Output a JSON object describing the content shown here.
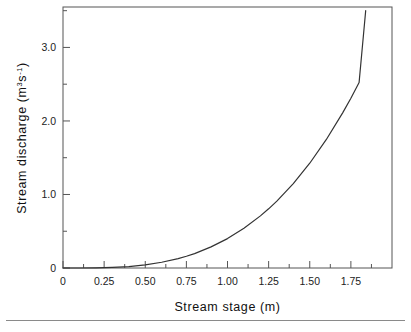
{
  "chart_data": {
    "type": "line",
    "title": "",
    "subtitle": "",
    "xlabel": "Stream  stage  (m)",
    "ylabel_parts": {
      "main": "Stream discharge  (m",
      "sup1": "3",
      "mid": "s",
      "sup2": "-1",
      "tail": ")"
    },
    "ylabel": "Stream discharge (m3s-1)",
    "xlim": [
      0,
      2.0
    ],
    "ylim": [
      0,
      3.55
    ],
    "grid": false,
    "legend": "none",
    "x_major_ticks": [
      0,
      0.25,
      0.5,
      0.75,
      1.0,
      1.25,
      1.5,
      1.75
    ],
    "x_tick_labels": [
      "0",
      "0.25",
      "0.50",
      "0.75",
      "1.00",
      "1.25",
      "1.50",
      "1.75"
    ],
    "x_minor_ticks": [
      0.125,
      0.375,
      0.625,
      0.875,
      1.125,
      1.375,
      1.625,
      1.875
    ],
    "y_major_ticks": [
      0,
      1.0,
      2.0,
      3.0
    ],
    "y_tick_labels": [
      "0",
      "1.0",
      "2.0",
      "3.0"
    ],
    "y_minor_ticks": [
      0.5,
      1.5,
      2.5,
      3.5
    ],
    "series": [
      {
        "name": "rating curve",
        "color": "#333333",
        "x": [
          0.0,
          0.1,
          0.2,
          0.25,
          0.3,
          0.4,
          0.5,
          0.6,
          0.7,
          0.75,
          0.8,
          0.9,
          1.0,
          1.1,
          1.2,
          1.25,
          1.3,
          1.4,
          1.5,
          1.6,
          1.7,
          1.75,
          1.8,
          1.84
        ],
        "y": [
          0.0,
          0.0,
          0.002,
          0.004,
          0.008,
          0.02,
          0.043,
          0.078,
          0.128,
          0.16,
          0.196,
          0.287,
          0.4,
          0.54,
          0.709,
          0.805,
          0.909,
          1.147,
          1.425,
          1.745,
          2.11,
          2.31,
          2.523,
          3.5
        ]
      }
    ]
  },
  "axes_geometry": {
    "plot_left": 63,
    "plot_right": 392,
    "plot_top": 7,
    "plot_bottom": 268
  },
  "footer": {
    "divider": "horizontal-rule"
  }
}
